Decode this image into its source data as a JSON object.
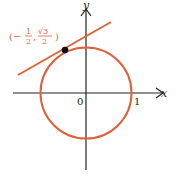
{
  "diagram": {
    "axes": {
      "x_label": "x",
      "y_label": "y",
      "origin_label": "0",
      "tick_label": "1"
    },
    "circle": {
      "center": [
        0,
        0
      ],
      "radius": 1,
      "color": "#e0603a"
    },
    "point": {
      "label": "(−1/2, √3/2)",
      "label_prefix": "(−",
      "frac1_num": "1",
      "frac1_den": "2",
      "sep": ",",
      "frac2_num": "√3",
      "frac2_den": "2",
      "label_suffix": ")",
      "color": "#111111"
    },
    "tangent_line": {
      "color": "#e0603a"
    },
    "label_color": "#e0603a"
  }
}
